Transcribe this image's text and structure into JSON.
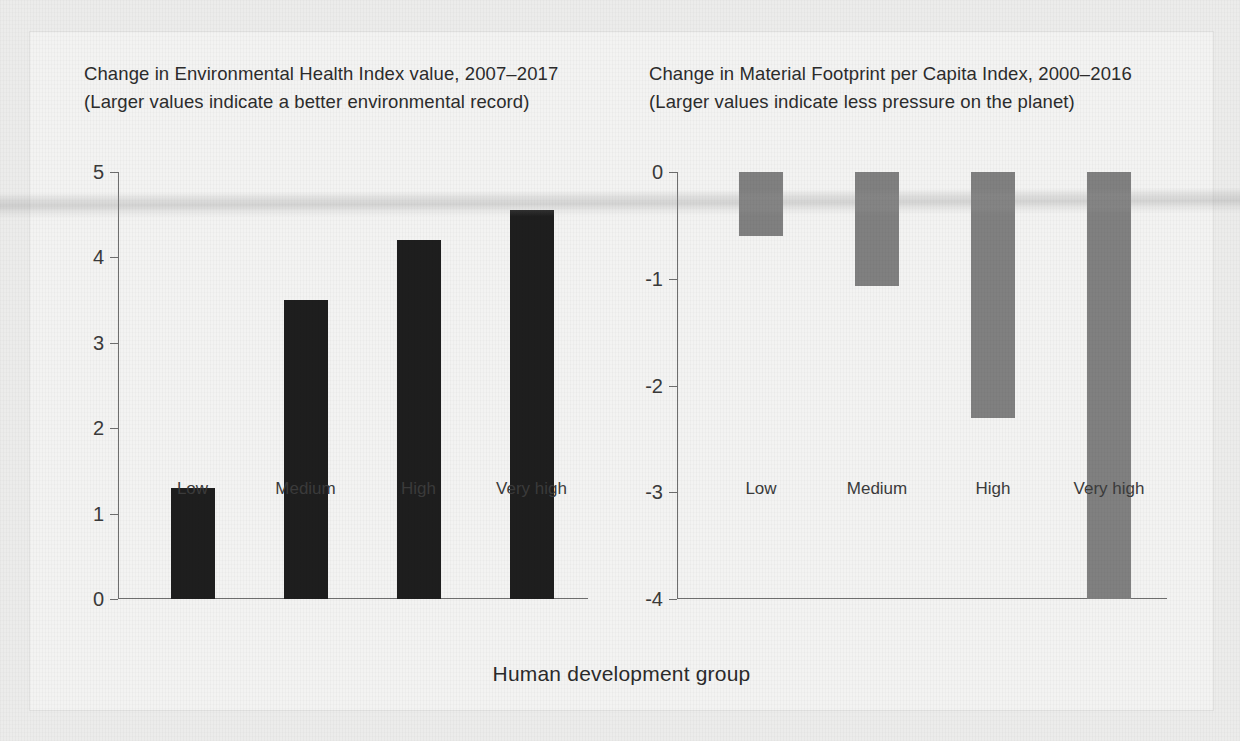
{
  "figure": {
    "axis_title": "Human development group",
    "categories": [
      "Low",
      "Medium",
      "High",
      "Very high"
    ]
  },
  "left_panel": {
    "title_line1": "Change in Environmental Health Index value, 2007–2017",
    "title_line2": "(Larger values indicate a better environmental record)",
    "y_ticks": [
      "5",
      "4",
      "3",
      "2",
      "1",
      "0"
    ]
  },
  "right_panel": {
    "title_line1": "Change in Material Footprint per Capita Index, 2000–2016",
    "title_line2": "(Larger values indicate less pressure on the planet)",
    "y_ticks": [
      "0",
      "-1",
      "-2",
      "-3",
      "-4"
    ]
  },
  "colors": {
    "bar_dark": "#1e1e1e",
    "bar_grey": "#808080",
    "axis": "#6e6e6e",
    "text": "#2c2c2c",
    "panel_background": "#f3f3f2",
    "page_background": "#ececeb"
  },
  "chart_data": [
    {
      "type": "bar",
      "title": "Change in Environmental Health Index value, 2007–2017 (Larger values indicate a better environmental record)",
      "xlabel": "Human development group",
      "ylabel": "",
      "categories": [
        "Low",
        "Medium",
        "High",
        "Very high"
      ],
      "values": [
        1.3,
        3.5,
        4.2,
        4.55
      ],
      "ylim": [
        0,
        5
      ],
      "yticks": [
        0,
        1,
        2,
        3,
        4,
        5
      ],
      "grid": false,
      "legend": "none",
      "bar_color": "#1e1e1e"
    },
    {
      "type": "bar",
      "title": "Change in Material Footprint per Capita Index, 2000–2016 (Larger values indicate less pressure on the planet)",
      "xlabel": "Human development group",
      "ylabel": "",
      "categories": [
        "Low",
        "Medium",
        "High",
        "Very high"
      ],
      "values": [
        -0.6,
        -1.07,
        -2.3,
        -4.0
      ],
      "ylim": [
        -4,
        0
      ],
      "yticks": [
        0,
        -1,
        -2,
        -3,
        -4
      ],
      "grid": false,
      "legend": "none",
      "bar_color": "#808080"
    }
  ]
}
